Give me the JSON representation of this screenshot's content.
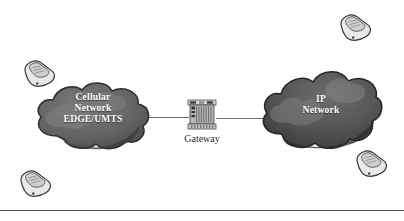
{
  "diagram": {
    "background_color": "#ffffff"
  },
  "clouds": [
    {
      "id": "cellular",
      "name": "cellular-network-cloud",
      "lines": [
        "Cellular",
        "Network",
        "EDGE/UMTS"
      ],
      "fill_color": "#6a6a6a",
      "shade_color": "#4d4d4d",
      "text_color": "#ffffff"
    },
    {
      "id": "ip",
      "name": "ip-network-cloud",
      "lines": [
        "IP",
        "Network"
      ],
      "fill_color": "#555555",
      "shade_color": "#3a3a3a",
      "text_color": "#ffffff"
    }
  ],
  "gateway": {
    "label": "Gateway",
    "icon": "server-rack-icon",
    "label_color": "#2b2b2b"
  },
  "links": [
    {
      "name": "link-cellular-to-gateway",
      "color": "#6d6d6d"
    },
    {
      "name": "link-gateway-to-ip",
      "color": "#6d6d6d"
    }
  ],
  "phones": [
    {
      "name": "mobile-phone-top-left",
      "icon": "mobile-phone-icon"
    },
    {
      "name": "mobile-phone-top-right",
      "icon": "mobile-phone-icon"
    },
    {
      "name": "mobile-phone-bottom-left",
      "icon": "mobile-phone-icon"
    },
    {
      "name": "mobile-phone-bottom-right",
      "icon": "mobile-phone-icon"
    }
  ],
  "rule": {
    "name": "bottom-divider",
    "color": "#4a4a4a"
  }
}
